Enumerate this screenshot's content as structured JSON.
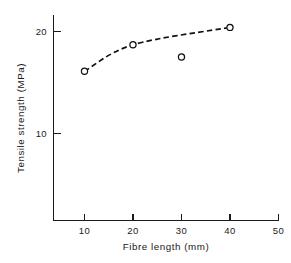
{
  "figure": {
    "background_color": "#ffffff",
    "ink_color": "#1a1a1a"
  },
  "chart_data": {
    "type": "scatter",
    "title": "",
    "xlabel": "Fibre  length  (mm)",
    "ylabel": "Tensile  strength  (MPa)",
    "xlim": [
      0,
      51
    ],
    "ylim": [
      0,
      22.2
    ],
    "xticks": [
      10,
      20,
      30,
      40,
      50
    ],
    "xtick_labels": [
      "10",
      "20",
      "30",
      "40",
      "50"
    ],
    "yticks": [
      10,
      20
    ],
    "ytick_labels": [
      "10",
      "20"
    ],
    "grid": false,
    "legend": null,
    "marker_style": "open-circle",
    "x": [
      10,
      20,
      30,
      40
    ],
    "y": [
      16.1,
      18.7,
      17.5,
      20.4
    ],
    "series": [
      {
        "name": "Tensile strength",
        "marker": "open-circle",
        "points": [
          {
            "x": 10,
            "y": 16.1,
            "on_curve": true
          },
          {
            "x": 20,
            "y": 18.7,
            "on_curve": true
          },
          {
            "x": 30,
            "y": 17.5,
            "on_curve": false
          },
          {
            "x": 40,
            "y": 20.4,
            "on_curve": true
          }
        ]
      }
    ],
    "fit_curve": {
      "style": "dashed",
      "through_points": [
        {
          "x": 10,
          "y": 16.1
        },
        {
          "x": 20,
          "y": 18.7
        },
        {
          "x": 40,
          "y": 20.4
        }
      ],
      "note": "dashed trend line omits the 30 mm point"
    }
  }
}
